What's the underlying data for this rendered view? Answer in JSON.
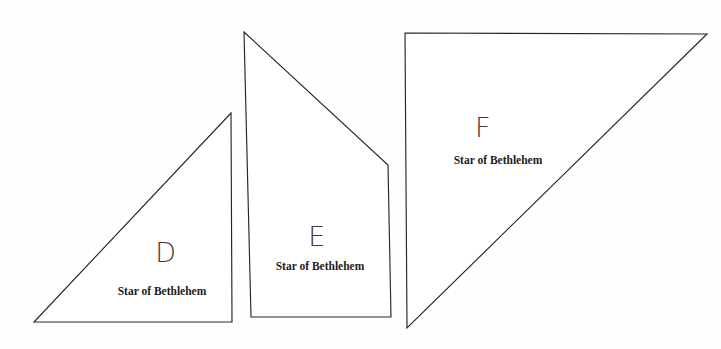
{
  "canvas": {
    "width": 721,
    "height": 349,
    "background_color": "#fefefe",
    "line_color": "#262626",
    "text_color": "#1c1c1c"
  },
  "pieces": [
    {
      "id": "piece-d",
      "letter": "D",
      "caption": "Star of Bethlehem",
      "shape": "right-triangle",
      "points": "34,322 232,322 231,113",
      "letter_x": 166,
      "letter_y": 252,
      "caption_x": 162,
      "caption_y": 291
    },
    {
      "id": "piece-e",
      "letter": "E",
      "caption": "Star of Bethlehem",
      "shape": "quadrilateral",
      "points": "244,32 388,165 391,317 251,317",
      "letter_x": 317,
      "letter_y": 236,
      "caption_x": 320,
      "caption_y": 266
    },
    {
      "id": "piece-f",
      "letter": "F",
      "caption": "Star of Bethlehem",
      "shape": "right-triangle",
      "points": "405,33 707,34 407,328",
      "letter_x": 483,
      "letter_y": 127,
      "caption_x": 498,
      "caption_y": 160
    }
  ]
}
